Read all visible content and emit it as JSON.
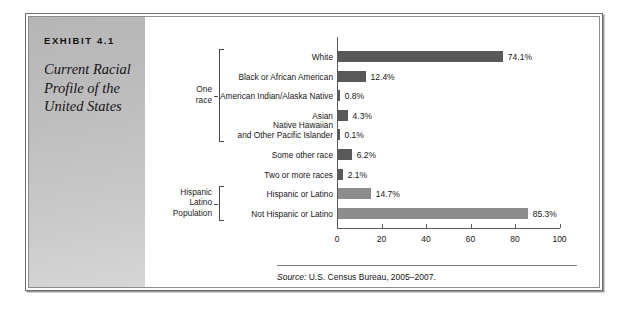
{
  "exhibit": {
    "number": "EXHIBIT 4.1",
    "title": "Current Racial Profile of the United States",
    "source_lead": "Source:",
    "source_rest": " U.S. Census Bureau, 2005–2007."
  },
  "groups": [
    {
      "label_lines": [
        "One",
        "race"
      ],
      "start": 0,
      "end": 4
    },
    {
      "label_lines": [
        "Hispanic",
        "Latino",
        "Population"
      ],
      "start": 7,
      "end": 8
    }
  ],
  "colors": {
    "bar_dark": "#595959",
    "bar_light": "#8c8c8c",
    "panel_gray": "#c2c2c2",
    "axis": "#5b5b5b",
    "text": "#161616"
  },
  "chart_data": {
    "type": "bar",
    "orientation": "horizontal",
    "title": "Current Racial Profile of the United States",
    "xlabel": "",
    "ylabel": "",
    "xlim": [
      0,
      100
    ],
    "xticks": [
      0,
      20,
      40,
      60,
      80,
      100
    ],
    "xtick_labels": [
      "0",
      "20",
      "40",
      "60",
      "80",
      "100"
    ],
    "grid": false,
    "legend": null,
    "source": "Source: U.S. Census Bureau, 2005–2007.",
    "categories": [
      "White",
      "Black or African American",
      "American Indian/Alaska Native",
      "Asian",
      "Native Hawaiian and Other Pacific Islander",
      "Some other race",
      "Two or more races",
      "Hispanic or Latino",
      "Not Hispanic or Latino"
    ],
    "category_label_lines": [
      [
        "White"
      ],
      [
        "Black or African American"
      ],
      [
        "American Indian/Alaska Native"
      ],
      [
        "Asian"
      ],
      [
        "Native Hawaiian",
        "and Other Pacific Islander"
      ],
      [
        "Some other race"
      ],
      [
        "Two or more races"
      ],
      [
        "Hispanic or Latino"
      ],
      [
        "Not Hispanic or Latino"
      ]
    ],
    "values": [
      74.1,
      12.4,
      0.8,
      4.3,
      0.1,
      6.2,
      2.1,
      14.7,
      85.3
    ],
    "value_labels": [
      "74.1%",
      "12.4%",
      "0.8%",
      "4.3%",
      "0.1%",
      "6.2%",
      "2.1%",
      "14.7%",
      "85.3%"
    ],
    "bar_colors": [
      "#595959",
      "#595959",
      "#595959",
      "#595959",
      "#595959",
      "#595959",
      "#595959",
      "#8c8c8c",
      "#8c8c8c"
    ]
  }
}
